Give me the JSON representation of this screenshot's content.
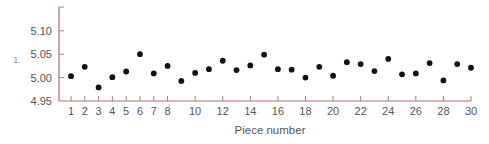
{
  "chart_data": {
    "type": "scatter",
    "title": "",
    "xlabel": "Piece number",
    "ylabel": "",
    "stray_label": "1.",
    "xlim": [
      1,
      30
    ],
    "ylim": [
      4.95,
      5.13
    ],
    "grid": false,
    "legend": null,
    "x_ticks": [
      1,
      2,
      3,
      4,
      5,
      6,
      7,
      8,
      10,
      12,
      14,
      16,
      18,
      20,
      22,
      24,
      26,
      28,
      30
    ],
    "x_tick_labels": [
      "1",
      "2",
      "3",
      "4",
      "5",
      "6",
      "7",
      "8",
      "10",
      "12",
      "14",
      "16",
      "18",
      "20",
      "22",
      "24",
      "26",
      "28",
      "30"
    ],
    "y_ticks": [
      4.95,
      5.0,
      5.05,
      5.1
    ],
    "y_tick_labels": [
      "4.95",
      "5.00",
      "5.05",
      "5.10"
    ],
    "series": [
      {
        "name": "measurement",
        "marker": "circle",
        "color": "#111111",
        "x": [
          1,
          2,
          3,
          4,
          5,
          6,
          7,
          8,
          9,
          10,
          11,
          12,
          13,
          14,
          15,
          16,
          17,
          18,
          19,
          20,
          21,
          22,
          23,
          24,
          25,
          26,
          27,
          28,
          29,
          30
        ],
        "y": [
          5.003,
          5.023,
          4.979,
          5.001,
          5.013,
          5.05,
          5.009,
          5.025,
          4.993,
          5.01,
          5.018,
          5.036,
          5.016,
          5.026,
          5.049,
          5.018,
          5.017,
          5.0,
          5.023,
          5.004,
          5.033,
          5.029,
          5.014,
          5.04,
          5.007,
          5.009,
          5.031,
          4.994,
          5.029,
          5.021
        ]
      }
    ]
  },
  "style": {
    "axis_color": "#b56a72",
    "tick_color": "#8a8a8a",
    "text_color": "#555555",
    "marker_color": "#111111"
  }
}
